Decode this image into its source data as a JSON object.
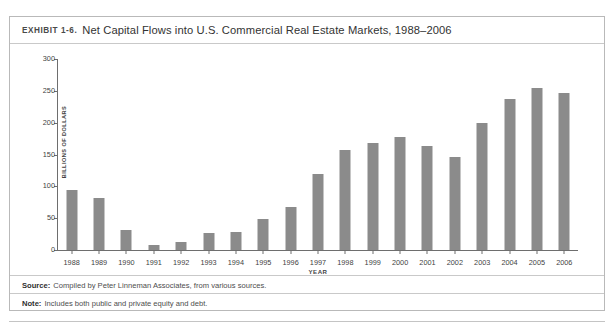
{
  "exhibit": {
    "label": "EXHIBIT 1-6.",
    "title": "Net Capital Flows into U.S. Commercial Real Estate Markets, 1988–2006"
  },
  "footnotes": {
    "source_key": "Source:",
    "source_text": "Compiled by Peter Linneman Associates, from various sources.",
    "note_key": "Note:",
    "note_text": "Includes both public and private equity and debt."
  },
  "colors": {
    "bar": "#8b8b8b",
    "axis": "#6e6e6e",
    "frame": "#b9b9b9",
    "text": "#3f3f3f"
  },
  "chart_data": {
    "type": "bar",
    "title": "Net Capital Flows into U.S. Commercial Real Estate Markets, 1988–2006",
    "xlabel": "YEAR",
    "ylabel": "BILLIONS OF DOLLARS",
    "ylim": [
      0,
      300
    ],
    "yticks": [
      0,
      50,
      100,
      150,
      200,
      250,
      300
    ],
    "ytick_labels": [
      "0",
      "50",
      "100",
      "150",
      "200",
      "250",
      "300"
    ],
    "grid": false,
    "legend": null,
    "categories": [
      "1988",
      "1989",
      "1990",
      "1991",
      "1992",
      "1993",
      "1994",
      "1995",
      "1996",
      "1997",
      "1998",
      "1999",
      "2000",
      "2001",
      "2002",
      "2003",
      "2004",
      "2005",
      "2006"
    ],
    "values": [
      95,
      81,
      31,
      8,
      13,
      27,
      29,
      48,
      68,
      119,
      157,
      168,
      178,
      163,
      146,
      199,
      237,
      255,
      246
    ],
    "units": "Billions of dollars"
  }
}
